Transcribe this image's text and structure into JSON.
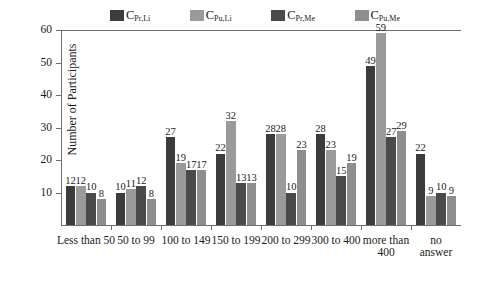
{
  "chart_data": {
    "type": "bar",
    "title": "",
    "xlabel": "",
    "ylabel": "Number of Participants",
    "ylim": [
      0,
      60
    ],
    "yticks": [
      0,
      10,
      20,
      30,
      40,
      50,
      60
    ],
    "grid": false,
    "legend_position": "top",
    "categories": [
      "Less than 50",
      "50 to 99",
      "100 to 149",
      "150 to 199",
      "200 to 299",
      "300 to 400",
      "more than\n400",
      "no answer"
    ],
    "series": [
      {
        "name": "C_Pr,Li",
        "label_main": "C",
        "label_sub": "Pr,Li",
        "color": "#3c3c3c",
        "values": [
          12,
          10,
          27,
          22,
          28,
          28,
          49,
          22
        ]
      },
      {
        "name": "C_Pu,Li",
        "label_main": "C",
        "label_sub": "Pu,Li",
        "color": "#9a9a9a",
        "values": [
          12,
          11,
          19,
          32,
          28,
          23,
          59,
          9
        ]
      },
      {
        "name": "C_Pr,Me",
        "label_main": "C",
        "label_sub": "Pr,Me",
        "color": "#4a4a4a",
        "values": [
          10,
          12,
          17,
          13,
          10,
          15,
          27,
          10
        ]
      },
      {
        "name": "C_Pu,Me",
        "label_main": "C",
        "label_sub": "Pu,Me",
        "color": "#8e8e8e",
        "values": [
          8,
          8,
          17,
          13,
          23,
          19,
          29,
          9
        ]
      }
    ]
  },
  "axis": {
    "tick_labels": [
      "0",
      "10",
      "20",
      "30",
      "40",
      "50",
      "60"
    ],
    "tick_labels_visible": [
      "",
      "10",
      "20",
      "30",
      "40",
      "50",
      "60"
    ]
  }
}
